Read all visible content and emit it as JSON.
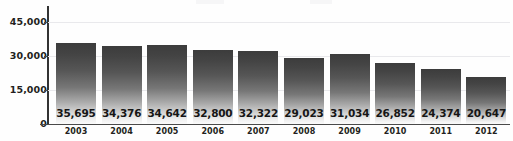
{
  "chart_data": {
    "type": "bar",
    "title": "",
    "subtitle": "",
    "xlabel": "",
    "ylabel": "",
    "categories": [
      "2003",
      "2004",
      "2005",
      "2006",
      "2007",
      "2008",
      "2009",
      "2010",
      "2011",
      "2012"
    ],
    "values": [
      35695,
      34376,
      34642,
      32800,
      32322,
      29023,
      31034,
      26852,
      24374,
      20647
    ],
    "value_labels": [
      "35,695",
      "34,376",
      "34,642",
      "32,800",
      "32,322",
      "29,023",
      "31,034",
      "26,852",
      "24,374",
      "20,647"
    ],
    "ylim": [
      0,
      45000
    ],
    "y_ticks": [
      0,
      15000,
      30000,
      45000
    ],
    "y_tick_labels": [
      "0",
      "15,000",
      "30,000",
      "45,000"
    ],
    "grid": true,
    "legend": false,
    "legend_position": "none",
    "series": [
      {
        "name": "",
        "values": [
          35695,
          34376,
          34642,
          32800,
          32322,
          29023,
          31034,
          26852,
          24374,
          20647
        ]
      }
    ],
    "colors": {
      "bar_top": "#3c3c3c",
      "bar_bottom": "#fbfbfb",
      "axis": "#333333",
      "gridline": "#e9e9ec",
      "text": "#231f20",
      "background": "#fefefe"
    }
  }
}
